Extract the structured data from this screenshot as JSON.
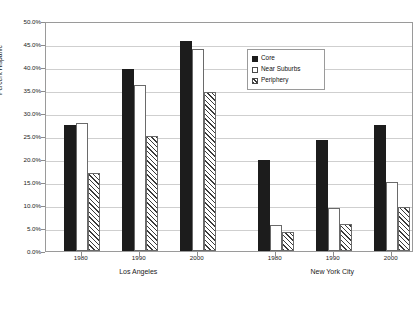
{
  "chart_data": {
    "type": "bar",
    "title": "",
    "subtitle": "",
    "xlabel": "",
    "ylabel": "Percent Hispanic",
    "ylim": [
      0,
      50
    ],
    "ytick_step": 5,
    "ytick_labels": [
      "50.0%",
      "45.0%",
      "40.0%",
      "35.0%",
      "30.0%",
      "25.0%",
      "20.0%",
      "15.0%",
      "10.0%",
      "5.0%",
      "0.0%"
    ],
    "ytick_values": [
      50,
      45,
      40,
      35,
      30,
      25,
      20,
      15,
      10,
      5,
      0
    ],
    "grid": true,
    "legend_position": "top-center-right",
    "legend": [
      "Core",
      "Near Suburbs",
      "Periphery"
    ],
    "groups": [
      {
        "name": "Los Angeles",
        "categories": [
          "1980",
          "1990",
          "2000"
        ],
        "series": [
          {
            "name": "Core",
            "values": [
              27.5,
              39.5,
              45.6
            ]
          },
          {
            "name": "Near Suburbs",
            "values": [
              27.8,
              36.1,
              44.0
            ]
          },
          {
            "name": "Periphery",
            "values": [
              17.0,
              25.0,
              34.5
            ]
          }
        ]
      },
      {
        "name": "New York City",
        "categories": [
          "1980",
          "1990",
          "2000"
        ],
        "series": [
          {
            "name": "Core",
            "values": [
              19.8,
              24.2,
              27.4
            ]
          },
          {
            "name": "Near Suburbs",
            "values": [
              5.7,
              9.4,
              15.0
            ]
          },
          {
            "name": "Periphery",
            "values": [
              4.2,
              5.9,
              9.5
            ]
          }
        ]
      }
    ]
  },
  "axis": {
    "y_title": "Percent Hispanic"
  }
}
